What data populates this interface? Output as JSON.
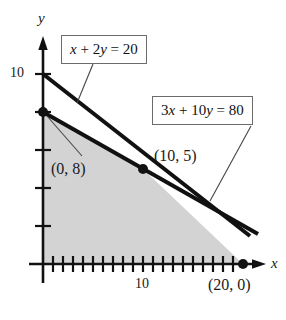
{
  "figure": {
    "type": "linear-programming-feasible-region",
    "axes": {
      "x_axis_label": "x",
      "y_axis_label": "y",
      "x_tick_label": "10",
      "y_tick_label": "10",
      "origin_px": [
        43,
        264
      ],
      "x_unit_px": 10,
      "y_unit_px": 19,
      "x_ticks": [
        1,
        2,
        3,
        4,
        5,
        6,
        7,
        8,
        9,
        10,
        11,
        12,
        13,
        14,
        15,
        16,
        17,
        18,
        19,
        20
      ],
      "y_ticks": [
        2,
        4,
        6,
        8,
        10
      ]
    },
    "equations": [
      {
        "id": "line1",
        "label_html": "<i>x</i> + 2<i>y</i> = 20",
        "label_text": "x + 2y = 20"
      },
      {
        "id": "line2",
        "label_html": "3<i>x</i> + 10<i>y</i> = 80",
        "label_text": "3x + 10y = 80"
      }
    ],
    "points": [
      {
        "label": "(0, 8)",
        "x": 0,
        "y": 8
      },
      {
        "label": "(10, 5)",
        "x": 10,
        "y": 5
      },
      {
        "label": "(20, 0)",
        "x": 20,
        "y": 0
      }
    ],
    "colors": {
      "region_fill": "#d3d3d3",
      "line": "#111111",
      "axis": "#111111",
      "box_border": "#6b6b6b",
      "leader": "#444444"
    }
  },
  "chart_data": {
    "type": "line",
    "title": "",
    "xlabel": "x",
    "ylabel": "y",
    "xlim": [
      0,
      22
    ],
    "ylim": [
      0,
      11
    ],
    "grid": false,
    "legend": "inline-boxes",
    "series": [
      {
        "name": "x + 2y = 20",
        "points": [
          [
            0,
            10
          ],
          [
            10,
            5
          ],
          [
            20,
            0
          ],
          [
            21,
            -0.5
          ]
        ],
        "x_intercept": 20,
        "y_intercept": 10
      },
      {
        "name": "3x + 10y = 80",
        "points": [
          [
            0,
            8
          ],
          [
            10,
            5
          ],
          [
            20,
            2
          ],
          [
            21.5,
            1.55
          ]
        ],
        "x_intercept": 26.67,
        "y_intercept": 8
      }
    ],
    "shaded_region": {
      "label": "feasible region",
      "vertices": [
        [
          0,
          0
        ],
        [
          0,
          8
        ],
        [
          10,
          5
        ],
        [
          20,
          0
        ]
      ],
      "fill": "#d3d3d3"
    },
    "annotations": [
      {
        "text": "(0, 8)",
        "x": 0,
        "y": 8
      },
      {
        "text": "(10, 5)",
        "x": 10,
        "y": 5
      },
      {
        "text": "(20, 0)",
        "x": 20,
        "y": 0
      }
    ]
  }
}
